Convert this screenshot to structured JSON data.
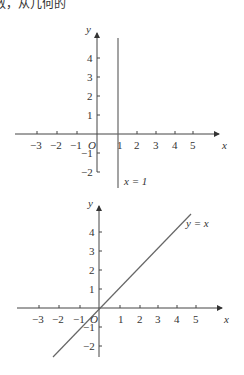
{
  "top_text": "数，从几何的",
  "figures": [
    {
      "name": "graph-x-equals-1",
      "origin_label": "O",
      "x_axis_label": "x",
      "y_axis_label": "y",
      "x_ticks": [
        "−3",
        "−2",
        "−1",
        "1",
        "2",
        "3",
        "4",
        "5"
      ],
      "y_ticks": [
        "4",
        "3",
        "2",
        "1",
        "−1",
        "−2"
      ],
      "line_label": "x = 1"
    },
    {
      "name": "graph-y-equals-x",
      "origin_label": "O",
      "x_axis_label": "x",
      "y_axis_label": "y",
      "x_ticks": [
        "−3",
        "−2",
        "−1",
        "1",
        "2",
        "3",
        "4",
        "5"
      ],
      "y_ticks": [
        "4",
        "3",
        "2",
        "1",
        "−1",
        "−2"
      ],
      "line_label": "y = x"
    }
  ],
  "colors": {
    "axis": "#444444",
    "line": "#666666",
    "text": "#333333"
  }
}
